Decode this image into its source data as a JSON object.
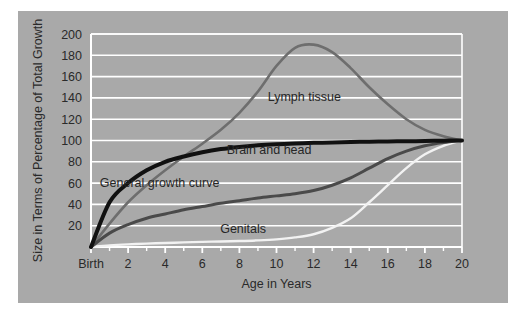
{
  "figure": {
    "panel_color": "#a9a9a9",
    "page_background": "#ffffff",
    "gridline_color": "#ffffff"
  },
  "chart_data": {
    "type": "line",
    "title": "",
    "subtitle": "",
    "xlabel": "Age in Years",
    "ylabel": "Size in Terms of Percentage of Total Growth",
    "xlim": [
      0,
      20
    ],
    "ylim": [
      0,
      200
    ],
    "grid": true,
    "grid_axis": "y",
    "legend_position": "inline-annotations",
    "x_tick_labels": [
      "Birth",
      "2",
      "4",
      "6",
      "8",
      "10",
      "12",
      "14",
      "16",
      "18",
      "20"
    ],
    "x_tick_values": [
      0,
      2,
      4,
      6,
      8,
      10,
      12,
      14,
      16,
      18,
      20
    ],
    "x_minor_tick_values": [
      1,
      3,
      5,
      7,
      9,
      11,
      13,
      15,
      17,
      19
    ],
    "y_tick_labels": [
      "20",
      "40",
      "60",
      "80",
      "100",
      "120",
      "140",
      "160",
      "180",
      "200"
    ],
    "y_tick_values": [
      20,
      40,
      60,
      80,
      100,
      120,
      140,
      160,
      180,
      200
    ],
    "x": [
      0,
      1,
      2,
      3,
      4,
      5,
      6,
      7,
      8,
      9,
      10,
      11,
      12,
      13,
      14,
      15,
      16,
      17,
      18,
      19,
      20
    ],
    "series": [
      {
        "name": "Lymph tissue",
        "color": "#6e6e6e",
        "width": 2.6,
        "label_x": 11.5,
        "label_y": 141,
        "values": [
          0,
          22,
          42,
          58,
          72,
          85,
          97,
          110,
          126,
          146,
          170,
          187,
          190,
          183,
          168,
          150,
          134,
          120,
          110,
          104,
          100
        ]
      },
      {
        "name": "Brain and head",
        "color": "#111111",
        "width": 4.0,
        "label_x": 9.6,
        "label_y": 92,
        "values": [
          0,
          42,
          60,
          72,
          80,
          85,
          89,
          92,
          94,
          95.5,
          96.5,
          97.2,
          97.8,
          98.2,
          98.6,
          98.9,
          99.1,
          99.3,
          99.5,
          99.8,
          100
        ]
      },
      {
        "name": "General growth curve",
        "color": "#4a4a4a",
        "width": 3.0,
        "label_x": 3.7,
        "label_y": 61,
        "values": [
          0,
          13,
          21,
          27,
          31,
          35,
          38,
          41,
          43.5,
          46,
          48,
          50,
          53,
          58,
          65,
          74,
          83,
          90,
          95,
          98,
          100
        ]
      },
      {
        "name": "Genitals",
        "color": "#f2f2f2",
        "width": 2.4,
        "label_x": 8.2,
        "label_y": 17,
        "values": [
          0,
          1.5,
          2.5,
          3.2,
          3.8,
          4.3,
          4.8,
          5.2,
          5.6,
          6.2,
          7.2,
          9,
          12,
          18,
          27,
          42,
          58,
          74,
          87,
          95,
          100
        ]
      }
    ]
  }
}
